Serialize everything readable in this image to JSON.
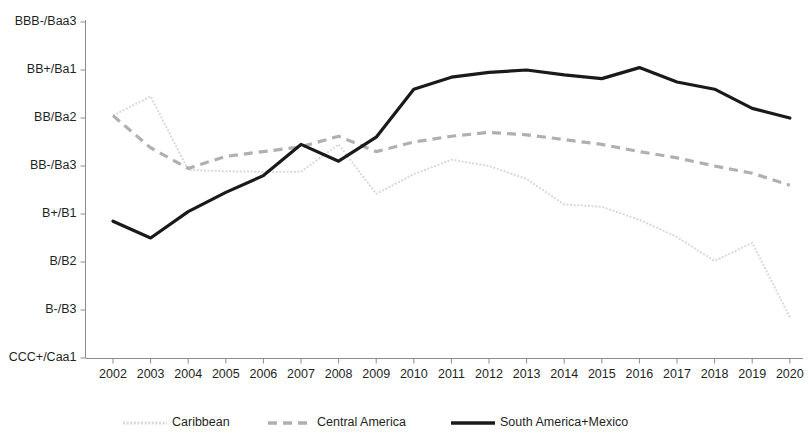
{
  "chart_data": {
    "type": "line",
    "title": "",
    "subtitle": "",
    "xlabel": "",
    "ylabel": "",
    "grid": false,
    "legend_position": "bottom",
    "categories": [
      "2002",
      "2003",
      "2004",
      "2005",
      "2006",
      "2007",
      "2008",
      "2009",
      "2010",
      "2011",
      "2012",
      "2013",
      "2014",
      "2015",
      "2016",
      "2017",
      "2018",
      "2019",
      "2020"
    ],
    "y_tick_labels": [
      "CCC+/Caa1",
      "B-/B3",
      "B/B2",
      "B+/B1",
      "BB-/Ba3",
      "BB/Ba2",
      "BB+/Ba1",
      "BBB-/Baa3"
    ],
    "y_tick_values": [
      1,
      2,
      3,
      4,
      5,
      6,
      7,
      8
    ],
    "ylim": [
      1,
      8
    ],
    "series": [
      {
        "name": "Caribbean",
        "style": "dotted",
        "color": "#d9d9d9",
        "values": [
          6.05,
          6.45,
          4.92,
          4.89,
          4.88,
          4.88,
          5.45,
          4.42,
          4.83,
          5.13,
          5.0,
          4.73,
          4.2,
          4.15,
          3.88,
          3.52,
          3.02,
          3.4,
          1.85
        ]
      },
      {
        "name": "Central America",
        "style": "dashed",
        "color": "#b0b0b0",
        "values": [
          6.05,
          5.38,
          4.95,
          5.2,
          5.3,
          5.4,
          5.62,
          5.3,
          5.5,
          5.62,
          5.7,
          5.65,
          5.55,
          5.45,
          5.3,
          5.17,
          5.0,
          4.85,
          4.6
        ]
      },
      {
        "name": "South America+Mexico",
        "style": "solid",
        "color": "#1a1a1a",
        "values": [
          3.85,
          3.5,
          4.05,
          4.45,
          4.8,
          5.45,
          5.1,
          5.6,
          6.6,
          6.85,
          6.95,
          7.0,
          6.9,
          6.82,
          7.05,
          6.75,
          6.6,
          6.2,
          6.0
        ]
      }
    ]
  },
  "legend": {
    "items": [
      {
        "label": "Caribbean"
      },
      {
        "label": "Central America"
      },
      {
        "label": "South America+Mexico"
      }
    ]
  }
}
